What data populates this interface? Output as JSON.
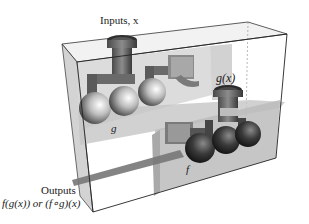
{
  "diagram": {
    "labels": {
      "inputs": "Inputs, x",
      "g_output": "g(x)",
      "g_machine": "g",
      "f_machine": "f",
      "outputs": "Outputs",
      "outputs_expr": "f(g(x)) or (f∘g)(x)"
    },
    "colors": {
      "box_edge": "#2a2a2a",
      "box_fill": "#e6e6e6",
      "shelf_fill": "#bdbdbd",
      "pipe": "#6e6e6e",
      "sphere_light": "#f2f2f2",
      "sphere_dark": "#2e2e2e",
      "output_chute": "#777777"
    }
  }
}
